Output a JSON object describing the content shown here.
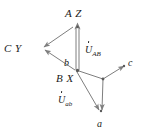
{
  "figure": {
    "kind": "phasor-vector-diagram",
    "width": 141,
    "height": 140,
    "background_color": "#ffffff",
    "line_color": "#7e7e7e",
    "text_color": "#1a1a1a"
  },
  "labels": {
    "top_terminal": "A Z",
    "left_terminal": "C Y",
    "center_terminal": "B X",
    "small_b": "b",
    "small_a": "a",
    "small_c": "c",
    "phasor_upper_u": "U",
    "phasor_upper_sub": "AB",
    "phasor_lower_u": "U",
    "phasor_lower_sub": "ab"
  },
  "nodes": [
    {
      "name": "node-AZ",
      "label": "A Z",
      "x": 77,
      "y": 24
    },
    {
      "name": "node-CY",
      "label": "C Y",
      "x": 35,
      "y": 50
    },
    {
      "name": "node-BX",
      "label": "B X",
      "x": 77,
      "y": 70
    },
    {
      "name": "node-center",
      "label": "",
      "x": 103,
      "y": 79
    },
    {
      "name": "node-a",
      "label": "a",
      "x": 100,
      "y": 116
    },
    {
      "name": "node-c",
      "label": "c",
      "x": 126,
      "y": 65
    }
  ],
  "vectors": [
    {
      "name": "vector-bx-to-az",
      "from": "node-BX",
      "to": "node-AZ",
      "arrow_at": "to",
      "style": "double"
    },
    {
      "name": "vector-az-to-cy",
      "from": "node-AZ",
      "to": "node-CY",
      "arrow_at": "to",
      "style": "single"
    },
    {
      "name": "vector-bx-to-cy",
      "from": "node-BX",
      "to": "node-CY",
      "arrow_at": "to",
      "style": "single"
    },
    {
      "name": "vector-bx-to-c",
      "from": "node-BX",
      "to": "node-center",
      "arrow_at": "none",
      "style": "single"
    },
    {
      "name": "vector-center-c",
      "from": "node-center",
      "to": "node-c",
      "arrow_at": "to",
      "style": "single"
    },
    {
      "name": "vector-center-a",
      "from": "node-center",
      "to": "node-a",
      "arrow_at": "to",
      "style": "single"
    },
    {
      "name": "vector-bx-to-a",
      "from": "node-BX",
      "to": "node-a",
      "arrow_at": "to",
      "style": "single"
    }
  ]
}
